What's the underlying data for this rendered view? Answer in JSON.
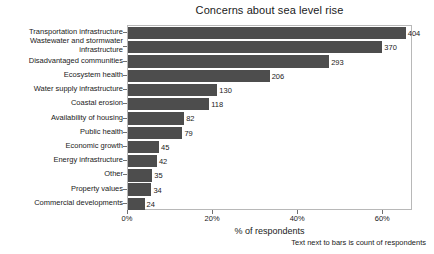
{
  "chart_data": {
    "type": "bar",
    "orientation": "horizontal",
    "title": "Concerns about sea level rise",
    "xlabel": "% of respondents",
    "ylabel": "",
    "footnote": "Text next to bars is count of respondents",
    "grid": false,
    "legend": "none",
    "xlim": [
      0,
      67
    ],
    "xticks": [
      0,
      20,
      40,
      60
    ],
    "xtick_labels": [
      "0%",
      "20%",
      "40%",
      "60%"
    ],
    "value_suffix": "%",
    "bar_color": "#4d4d4d",
    "axes_color": "#b8b8b8",
    "categories": [
      "Transportation infrastructure",
      "Wastewater and stormwater\ninfrastructure",
      "Disadvantaged communities",
      "Ecosystem health",
      "Water supply infrastructure",
      "Coastal erosion",
      "Availability of housing",
      "Public health",
      "Economic growth",
      "Energy infrastructure",
      "Other",
      "Property values",
      "Commercial developments"
    ],
    "counts": [
      404,
      370,
      293,
      206,
      130,
      118,
      82,
      79,
      45,
      42,
      35,
      34,
      24
    ],
    "values": [
      65.3,
      59.8,
      47.3,
      33.3,
      21.0,
      19.1,
      13.2,
      12.8,
      7.3,
      6.8,
      5.7,
      5.5,
      3.9
    ],
    "data_labels": [
      "404",
      "370",
      "293",
      "206",
      "130",
      "118",
      "82",
      "79",
      "45",
      "42",
      "35",
      "34",
      "24"
    ]
  }
}
